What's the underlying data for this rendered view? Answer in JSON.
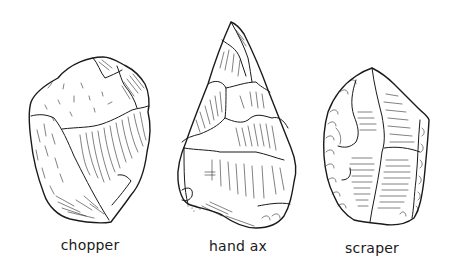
{
  "figure": {
    "background": "#ffffff",
    "ink_color": "#1a1a1a",
    "tools": [
      {
        "id": "chopper",
        "label": "chopper",
        "label_pos": {
          "x": 90,
          "y": 237
        }
      },
      {
        "id": "hand-ax",
        "label": "hand ax",
        "label_pos": {
          "x": 238,
          "y": 238
        }
      },
      {
        "id": "scraper",
        "label": "scraper",
        "label_pos": {
          "x": 372,
          "y": 240
        }
      }
    ]
  }
}
